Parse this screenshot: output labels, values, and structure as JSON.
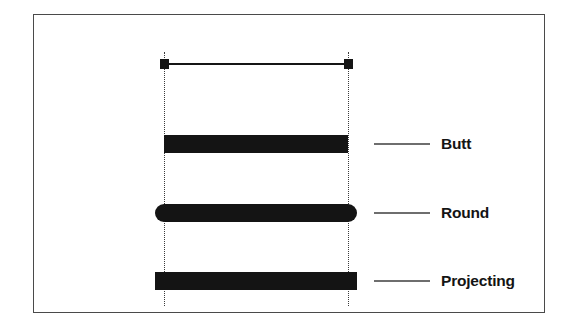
{
  "figure": {
    "background_color": "#ffffff",
    "frame_color": "#4a4a4a",
    "stroke_color": "#141414",
    "guide_color": "#3a3a3a",
    "leader_color": "#6e6e6e",
    "guides": [
      {
        "name": "left-guide",
        "style": "dotted"
      },
      {
        "name": "right-guide",
        "style": "dotted"
      }
    ],
    "reference_line": {
      "name": "zero-width-reference-line",
      "endpoint_marker": "square"
    },
    "examples": [
      {
        "label": "Butt",
        "cap": "butt",
        "extends_past_guides": false,
        "end_shape": "flat"
      },
      {
        "label": "Round",
        "cap": "round",
        "extends_past_guides": true,
        "end_shape": "semicircle"
      },
      {
        "label": "Projecting",
        "cap": "projecting",
        "extends_past_guides": true,
        "end_shape": "square"
      }
    ]
  }
}
